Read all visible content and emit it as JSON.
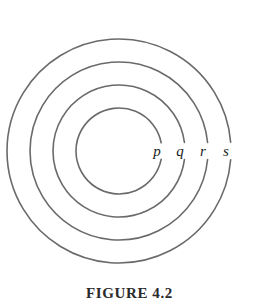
{
  "figure": {
    "caption": "FIGURE 4.2",
    "background_color": "#ffffff",
    "stroke_color": "#6a6a6a",
    "label_color": "#1a1a1a",
    "stroke_width": 1.6,
    "center": {
      "x": 119,
      "y": 151
    }
  },
  "chart_data": {
    "type": "diagram",
    "subtype": "concentric-circles",
    "title": "FIGURE 4.2",
    "center": {
      "x": 119,
      "y": 151
    },
    "grid": false,
    "legend": "none",
    "label_style": "italic-serif",
    "rings": [
      {
        "label": "p",
        "index": 1,
        "radius": 43,
        "label_x": 157,
        "label_y": 153,
        "gap_degrees": 22
      },
      {
        "label": "q",
        "index": 2,
        "radius": 66,
        "label_x": 180,
        "label_y": 153,
        "gap_degrees": 15
      },
      {
        "label": "r",
        "index": 3,
        "radius": 89,
        "label_x": 203,
        "label_y": 153,
        "gap_degrees": 11
      },
      {
        "label": "s",
        "index": 4,
        "radius": 112,
        "label_x": 226,
        "label_y": 153,
        "gap_degrees": 9
      }
    ]
  }
}
